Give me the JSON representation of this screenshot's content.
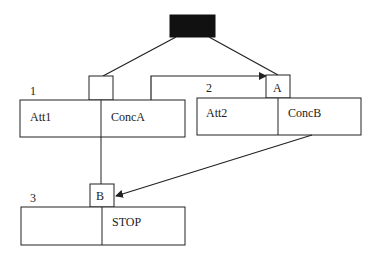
{
  "diagram": {
    "root": {
      "label": "",
      "fill": "#111111"
    },
    "nodes": [
      {
        "id": "1",
        "number": "1",
        "left_label": "Att1",
        "right_label": "ConcA",
        "tab_label": ""
      },
      {
        "id": "2",
        "number": "2",
        "left_label": "Att2",
        "right_label": "ConcB",
        "tab_label": "A"
      },
      {
        "id": "3",
        "number": "3",
        "left_label": "",
        "right_label": "STOP",
        "tab_label": "B"
      }
    ],
    "edges": [
      {
        "from": "root",
        "to": "1",
        "arrow": false
      },
      {
        "from": "root",
        "to": "2",
        "arrow": false
      },
      {
        "from": "1.ConcA",
        "to": "2.A",
        "arrow": true
      },
      {
        "from": "1",
        "to": "3.B",
        "arrow": false
      },
      {
        "from": "2.ConcB",
        "to": "3.B",
        "arrow": true
      }
    ],
    "colors": {
      "stroke": "#222222",
      "background": "#ffffff"
    }
  }
}
